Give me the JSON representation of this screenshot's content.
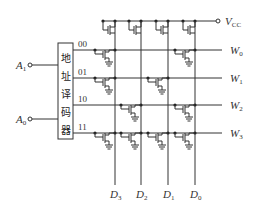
{
  "diagram": {
    "decoder": {
      "label_chars": [
        "地",
        "址",
        "译",
        "码",
        "器"
      ],
      "outputs": [
        "00",
        "01",
        "10",
        "11"
      ]
    },
    "inputs": [
      {
        "name": "A",
        "sub": "1"
      },
      {
        "name": "A",
        "sub": "0"
      }
    ],
    "supply": {
      "name": "V",
      "sub": "CC"
    },
    "word_lines": [
      {
        "name": "W",
        "sub": "0"
      },
      {
        "name": "W",
        "sub": "1"
      },
      {
        "name": "W",
        "sub": "2"
      },
      {
        "name": "W",
        "sub": "3"
      }
    ],
    "bit_lines": [
      {
        "name": "D",
        "sub": "3"
      },
      {
        "name": "D",
        "sub": "2"
      },
      {
        "name": "D",
        "sub": "1"
      },
      {
        "name": "D",
        "sub": "0"
      }
    ],
    "storage_matrix": [
      [
        1,
        0,
        0,
        1
      ],
      [
        1,
        0,
        1,
        0
      ],
      [
        0,
        1,
        0,
        1
      ],
      [
        1,
        1,
        1,
        1
      ]
    ],
    "colors": {
      "line": "#333333",
      "background": "#ffffff"
    }
  }
}
